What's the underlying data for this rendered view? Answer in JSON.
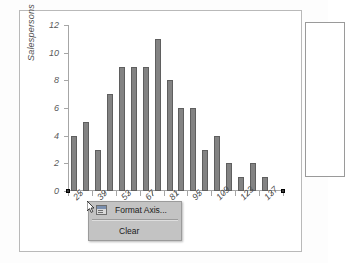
{
  "chart_data": {
    "type": "bar",
    "title": "",
    "xlabel": "s Sold",
    "ylabel": "Salespersons",
    "ylim": [
      0,
      12
    ],
    "yticks": [
      0,
      2,
      4,
      6,
      8,
      10,
      12
    ],
    "grid": false,
    "legend": "none",
    "categories": [
      "25",
      "32",
      "39",
      "46",
      "53",
      "60",
      "67",
      "74",
      "81",
      "88",
      "95",
      "102",
      "109",
      "116",
      "123",
      "130",
      "137",
      "144"
    ],
    "xtick_labels": [
      "25",
      "39",
      "53",
      "67",
      "81",
      "95",
      "109",
      "123",
      "137"
    ],
    "values": [
      4,
      5,
      3,
      7,
      9,
      9,
      9,
      11,
      8,
      6,
      6,
      3,
      4,
      2,
      1,
      2,
      1,
      0
    ],
    "series": [
      {
        "name": "Salespersons",
        "values": [
          4,
          5,
          3,
          7,
          9,
          9,
          9,
          11,
          8,
          6,
          6,
          3,
          4,
          2,
          1,
          2,
          1,
          0
        ],
        "color": "#838383"
      }
    ]
  },
  "chart": {
    "y_axis_title": "Salespersons",
    "x_axis_title": "s Sold",
    "bar_color": "#838383",
    "bar_border_color": "#5f5f5f",
    "axis_color": "#a6a6a6",
    "frame_color": "#b9b9b9"
  },
  "context_menu": {
    "items": [
      {
        "label": "Format Axis...",
        "icon": "format-axis-icon",
        "has_icon": true
      },
      {
        "label": "Clear",
        "icon": "",
        "has_icon": false
      }
    ]
  },
  "cursor": {
    "icon": "mouse-pointer-icon"
  }
}
